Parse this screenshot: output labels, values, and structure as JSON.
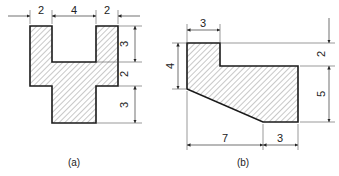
{
  "figures": [
    {
      "id": "a",
      "caption": "(a)",
      "dimensions": {
        "top": [
          "2",
          "4",
          "2"
        ],
        "right": [
          "3",
          "2",
          "3"
        ]
      }
    },
    {
      "id": "b",
      "caption": "(b)",
      "dimensions": {
        "top": [
          "3"
        ],
        "left": [
          "4"
        ],
        "right": [
          "2",
          "5"
        ],
        "bottom": [
          "7",
          "3"
        ]
      }
    }
  ],
  "colors": {
    "outline": "#1a1a1a",
    "hatch": "#444444",
    "background": "#ffffff"
  }
}
